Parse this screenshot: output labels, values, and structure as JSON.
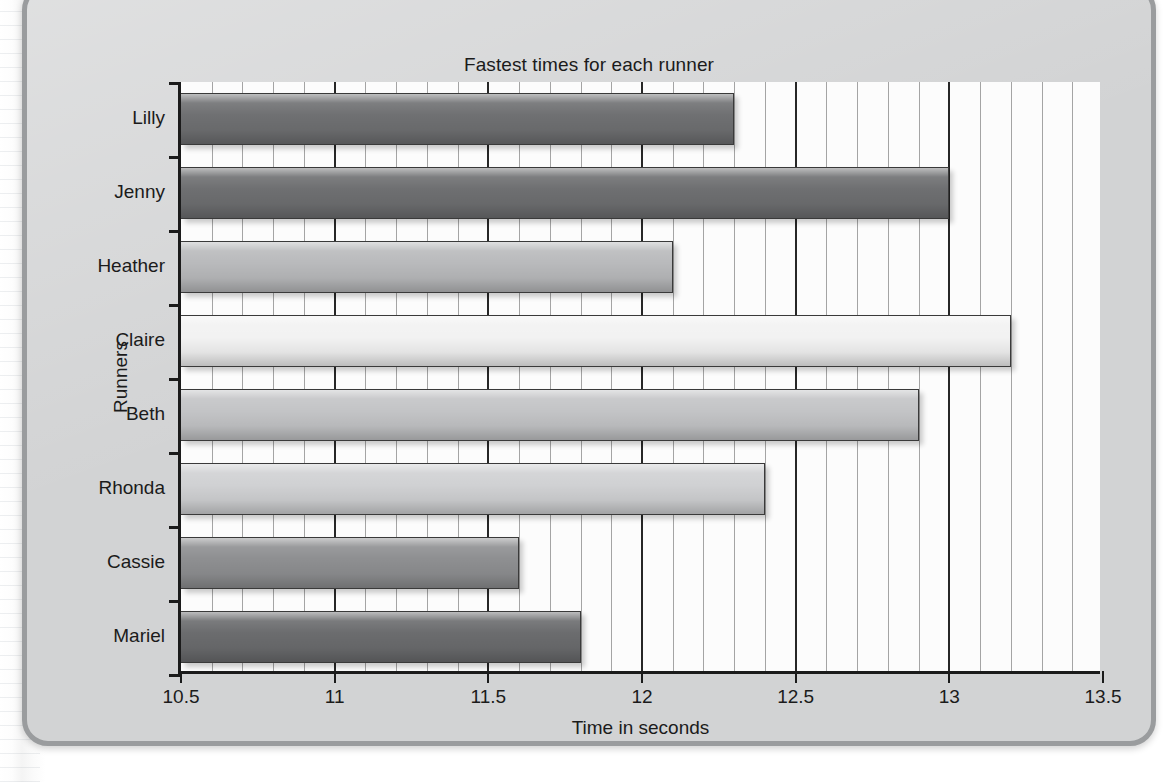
{
  "chart_data": {
    "type": "bar",
    "orientation": "horizontal",
    "title": "Fastest times for each runner",
    "xlabel": "Time in seconds",
    "ylabel": "Runners",
    "categories": [
      "Lilly",
      "Jenny",
      "Heather",
      "Claire",
      "Beth",
      "Rhonda",
      "Cassie",
      "Mariel"
    ],
    "values": [
      12.3,
      13.0,
      12.1,
      13.2,
      12.9,
      12.4,
      11.6,
      11.8
    ],
    "bar_colors": [
      "#6f7072",
      "#6e6f71",
      "#b9babc",
      "#f2f2f2",
      "#c3c4c6",
      "#d0d1d3",
      "#8e8f91",
      "#6b6c6e"
    ],
    "xlim": [
      10.5,
      13.5
    ],
    "xticks": [
      10.5,
      11,
      11.5,
      12,
      12.5,
      13,
      13.5
    ],
    "xtick_labels": [
      "10.5",
      "11",
      "11.5",
      "12",
      "12.5",
      "13",
      "13.5"
    ],
    "minor_tick_step": 0.1,
    "grid": "vertical-major-and-minor",
    "legend": "none",
    "plot_background": "#fcfcfc",
    "figure_background": "#d2d3d4",
    "axis_color": "#1b1b1b"
  }
}
